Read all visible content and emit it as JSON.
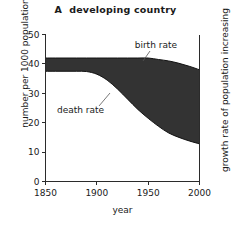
{
  "figure": {
    "panel_letter": "A",
    "title": "developing country",
    "background_color": "#ffffff",
    "band_color": "#333333"
  },
  "axes": {
    "y_left": {
      "label": "number per 1000 population",
      "ticks": [
        "0",
        "10",
        "20",
        "30",
        "40",
        "50"
      ],
      "min": 0,
      "max": 50
    },
    "y_right": {
      "label": "growth rate of population increasing"
    },
    "x": {
      "label": "year",
      "ticks": [
        "1850",
        "1900",
        "1950",
        "2000"
      ],
      "min": 1850,
      "max": 2000
    }
  },
  "annotations": [
    {
      "name": "birth-rate-label",
      "text": "birth rate"
    },
    {
      "name": "death-rate-label",
      "text": "death rate"
    }
  ],
  "chart_data": {
    "type": "area",
    "xlabel": "year",
    "ylabel": "number per 1000 population",
    "ylabel_right": "growth rate of population increasing",
    "xlim": [
      1850,
      2000
    ],
    "ylim": [
      0,
      50
    ],
    "xticks": [
      1850,
      1900,
      1950,
      2000
    ],
    "yticks": [
      0,
      10,
      20,
      30,
      40,
      50
    ],
    "grid": false,
    "legend": "none",
    "annotations": [
      "birth rate",
      "death rate"
    ],
    "fill_between": {
      "upper": "birth rate",
      "lower": "death rate",
      "color": "#333333",
      "meaning": "shaded gap = growth rate of population increasing"
    },
    "x": [
      1850,
      1860,
      1870,
      1880,
      1890,
      1900,
      1910,
      1920,
      1930,
      1940,
      1950,
      1960,
      1970,
      1980,
      1990,
      2000
    ],
    "series": [
      {
        "name": "birth rate",
        "values": [
          42,
          42,
          42,
          42,
          42,
          42,
          42,
          42,
          42,
          42,
          42,
          41.5,
          41,
          40.2,
          39.2,
          38
        ]
      },
      {
        "name": "death rate",
        "values": [
          37.5,
          37.5,
          37.5,
          37.5,
          37.4,
          36.5,
          34.5,
          31.5,
          28,
          24.5,
          21.5,
          18.8,
          16.5,
          15,
          13.8,
          12.8
        ]
      }
    ]
  }
}
